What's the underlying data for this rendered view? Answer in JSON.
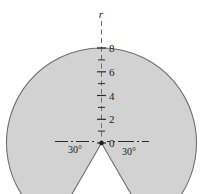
{
  "figure": {
    "name": "shaded-sector-polar-diagram",
    "background_color": "#ffffff",
    "shape_fill_color": "#d2d2d2",
    "shape_stroke_color": "#6e6e6e",
    "axis_color": "#6e6e6e",
    "text_color": "#1a1a1a"
  },
  "axis": {
    "label": "r",
    "orientation": "vertical-up",
    "style": "dashed",
    "origin_label": "0",
    "tick_labels": [
      "0",
      "2",
      "4",
      "6",
      "8"
    ],
    "tick_values": [
      0,
      2,
      4,
      6,
      8
    ],
    "minor_tick_values": [
      1,
      3,
      5,
      7
    ],
    "max": 8,
    "min": 0
  },
  "angles": {
    "left": "30°",
    "right": "30°",
    "left_value": 30,
    "right_value": 30,
    "reference_line_style": "dash-dot"
  },
  "chart_data": {
    "type": "polar-region",
    "title": "",
    "xlabel": "",
    "ylabel": "r",
    "radius": 8,
    "notch_half_angle_deg": 30,
    "notch_center_direction_deg": 270,
    "shaded_span_deg": 300,
    "rlim": [
      0,
      8
    ],
    "rticks": [
      0,
      2,
      4,
      6,
      8
    ],
    "grid": false,
    "legend": "none"
  }
}
